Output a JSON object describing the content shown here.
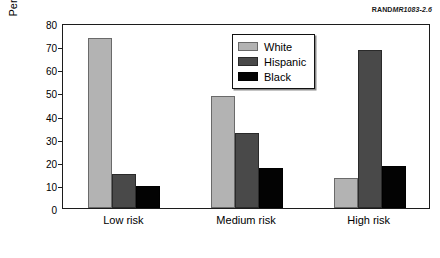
{
  "source_id": {
    "brand": "RAND",
    "document_number": "MR1083-2.6"
  },
  "legend": {
    "position": "upper-center-right",
    "entries": [
      {
        "label": "White",
        "color": "#b3b3b3"
      },
      {
        "label": "Hispanic",
        "color": "#494949"
      },
      {
        "label": "Black",
        "color": "#030303"
      }
    ]
  },
  "chart_data": {
    "type": "bar",
    "title": "",
    "xlabel": "",
    "ylabel": "Percentage of students",
    "categories": [
      "Low risk",
      "Medium risk",
      "High risk"
    ],
    "series": [
      {
        "name": "White",
        "color": "#b3b3b3",
        "values": [
          73.5,
          48.5,
          13.0
        ]
      },
      {
        "name": "Hispanic",
        "color": "#494949",
        "values": [
          14.5,
          32.5,
          68.5
        ]
      },
      {
        "name": "Black",
        "color": "#030303",
        "values": [
          9.5,
          17.5,
          18.0
        ]
      }
    ],
    "ylim": [
      0,
      80
    ],
    "ytick_labels": [
      "0",
      "10",
      "20",
      "30",
      "40",
      "50",
      "60",
      "70",
      "80"
    ],
    "ytick_values": [
      0,
      10,
      20,
      30,
      40,
      50,
      60,
      70,
      80
    ],
    "grid": false,
    "legend_position": "upper-center-right"
  }
}
